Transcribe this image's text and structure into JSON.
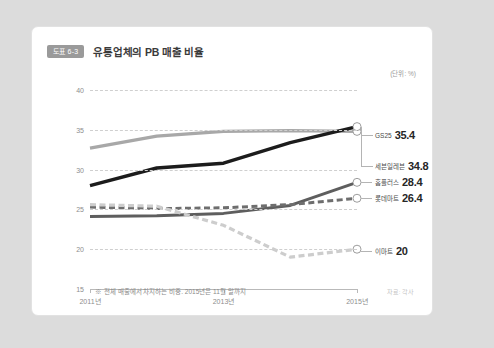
{
  "card": {
    "badge": "도표 6-3",
    "title": "유통업체의 PB 매출 비율",
    "unit_label": "(단위: %)",
    "footnote": "※ 전체 매출에서 차지하는 비중. 2015년은 11월 말까지",
    "source": "자료: 각사"
  },
  "chart_data": {
    "type": "line",
    "title": "유통업체의 PB 매출 비율",
    "xlabel": "",
    "ylabel": "",
    "unit": "%",
    "ylim": [
      15,
      40
    ],
    "yticks": [
      40,
      35,
      30,
      25,
      20,
      15
    ],
    "ytick_labels": [
      "40",
      "35",
      "30",
      "25",
      "20",
      "15"
    ],
    "grid": true,
    "grid_style": "dashed-horizontal",
    "xticks": [
      2011,
      2013,
      2015
    ],
    "xtick_labels": [
      "2011년",
      "2013년",
      "2015년"
    ],
    "xlim": [
      2011,
      2015
    ],
    "legend_position": "right-end-labels",
    "x": [
      2011,
      2012,
      2013,
      2014,
      2015
    ],
    "series": [
      {
        "name": "세븐일레븐",
        "values": [
          32.7,
          34.2,
          34.8,
          34.9,
          34.8
        ],
        "end_value": "34.8",
        "color": "#a8a8a8",
        "style": "solid",
        "width": 3.4,
        "marker_at_end": true
      },
      {
        "name": "GS25",
        "values": [
          28.0,
          30.2,
          30.8,
          33.4,
          35.4
        ],
        "end_value": "35.4",
        "color": "#1c1c1c",
        "style": "solid",
        "width": 3.4,
        "marker_at_end": true
      },
      {
        "name": "홈플러스",
        "values": [
          24.1,
          24.2,
          24.5,
          25.5,
          28.4
        ],
        "end_value": "28.4",
        "color": "#5e5e5e",
        "style": "solid",
        "width": 3.0,
        "marker_at_end": true
      },
      {
        "name": "롯데마트",
        "values": [
          25.3,
          25.1,
          25.2,
          25.6,
          26.4
        ],
        "end_value": "26.4",
        "color": "#6e6e6e",
        "style": "dashed",
        "width": 3.0,
        "marker_at_end": true
      },
      {
        "name": "이마트",
        "values": [
          25.6,
          25.4,
          23.0,
          19.0,
          20.0
        ],
        "end_value": "20",
        "color": "#cdcdcd",
        "style": "dashed",
        "width": 3.2,
        "marker_at_end": true
      }
    ]
  },
  "end_labels": [
    {
      "name": "GS25",
      "value": "35.4"
    },
    {
      "name": "세븐일레븐",
      "value": "34.8"
    },
    {
      "name": "홈플러스",
      "value": "28.4"
    },
    {
      "name": "롯데마트",
      "value": "26.4"
    },
    {
      "name": "이마트",
      "value": "20"
    }
  ]
}
